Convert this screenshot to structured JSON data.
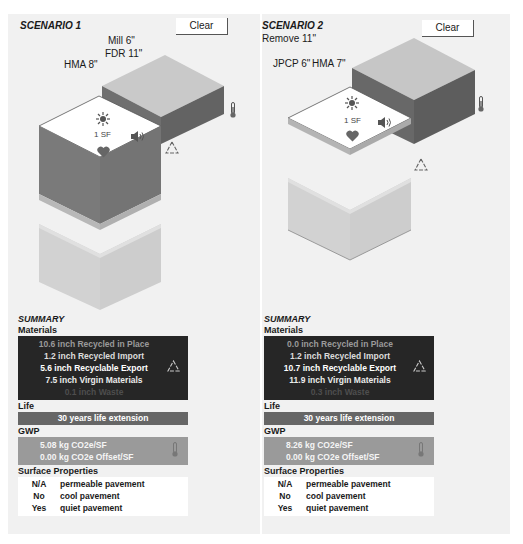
{
  "scenarios": [
    {
      "title": "SCENARIO 1",
      "clear_label": "Clear",
      "layer_labels": [
        "Mill 6\"",
        "FDR 11\"",
        "HMA 8\""
      ],
      "unit_label": "1 SF",
      "summary": {
        "title": "SUMMARY",
        "materials_label": "Materials",
        "materials": [
          "10.6 inch Recycled in Place",
          "1.2 inch Recycled Import",
          "5.6 inch Recyclable Export",
          "7.5 inch Virgin Materials",
          "0.1 inch Waste"
        ],
        "life_label": "Life",
        "life_value": "30 years life extension",
        "gwp_label": "GWP",
        "gwp_lines": [
          "5.08 kg CO2e/SF",
          "0.00 kg CO2e Offset/SF"
        ],
        "surface_label": "Surface Properties",
        "surface": [
          {
            "value": "N/A",
            "label": "permeable pavement"
          },
          {
            "value": "No",
            "label": "cool pavement"
          },
          {
            "value": "Yes",
            "label": "quiet pavement"
          }
        ]
      }
    },
    {
      "title": "SCENARIO 2",
      "clear_label": "Clear",
      "layer_labels": [
        "Remove 11\"",
        "JPCP 6\"",
        "HMA 7\""
      ],
      "unit_label": "1 SF",
      "summary": {
        "title": "SUMMARY",
        "materials_label": "Materials",
        "materials": [
          "0.0 inch Recycled in Place",
          "1.2 inch Recycled Import",
          "10.7 inch Recyclable Export",
          "11.9 inch Virgin Materials",
          "0.3 inch Waste"
        ],
        "life_label": "Life",
        "life_value": "30 years life extension",
        "gwp_label": "GWP",
        "gwp_lines": [
          "8.26 kg CO2e/SF",
          "0.00 kg CO2e Offset/SF"
        ],
        "surface_label": "Surface Properties",
        "surface": [
          {
            "value": "N/A",
            "label": "permeable pavement"
          },
          {
            "value": "No",
            "label": "cool pavement"
          },
          {
            "value": "Yes",
            "label": "quiet pavement"
          }
        ]
      }
    }
  ],
  "icons": {
    "sun": "sun-icon",
    "speaker": "speaker-icon",
    "heart": "heart-icon",
    "recycle": "recycle-icon",
    "thermometer": "thermometer-icon"
  },
  "colors": {
    "panel_bg": "#f1f1f1",
    "materials_bg": "#262626",
    "life_bg": "#666666",
    "gwp_bg": "#9a9a9a",
    "block_top_light": "#c9c9c9",
    "block_side_dark": "#6e6e6e",
    "block_side_darker": "#5e5e5e",
    "block_ghost": "#d6d6d6"
  }
}
